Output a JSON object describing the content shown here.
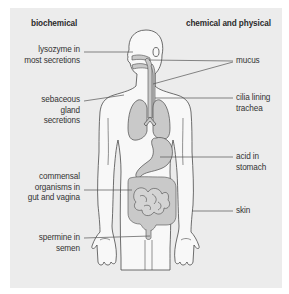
{
  "diagram": {
    "title_left": "biochemical",
    "title_right": "chemical and physical",
    "colors": {
      "background": "#ececec",
      "body_fill": "#f8f8f8",
      "organ_fill": "#c9c9c9",
      "outline": "#4a4a4a",
      "leader_line": "#555555",
      "text": "#333333"
    },
    "left_labels": [
      {
        "id": "lysozyme",
        "text": "lysozyme in\nmost secretions"
      },
      {
        "id": "sebaceous",
        "text": "sebaceous\ngland\nsecretions"
      },
      {
        "id": "commensal",
        "text": "commensal\norganisms in\ngut and vagina"
      },
      {
        "id": "spermine",
        "text": "spermine in\nsemen"
      }
    ],
    "right_labels": [
      {
        "id": "mucus",
        "text": "mucus"
      },
      {
        "id": "cilia",
        "text": "cilia lining\ntrachea"
      },
      {
        "id": "acid",
        "text": "acid in\nstomach"
      },
      {
        "id": "skin",
        "text": "skin"
      }
    ]
  }
}
